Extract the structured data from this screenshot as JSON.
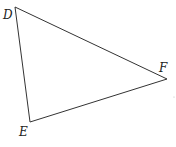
{
  "diagram": {
    "type": "triangle",
    "vertices": [
      {
        "name": "D",
        "x": 15,
        "y": 7
      },
      {
        "name": "F",
        "x": 167,
        "y": 79
      },
      {
        "name": "E",
        "x": 30,
        "y": 122
      }
    ],
    "labels": {
      "D": "D",
      "E": "E",
      "F": "F"
    },
    "stroke_color": "#333333"
  }
}
